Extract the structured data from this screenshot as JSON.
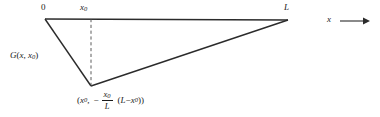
{
  "figure": {
    "kind": "greens-function-diagram",
    "background_color": "#ffffff",
    "line_color": "#2b2b2b",
    "text_color": "#1a1a1a"
  },
  "labels": {
    "origin": "0",
    "x0_top": "x",
    "x0_top_sub": "0",
    "L_top": "L",
    "function_name": "G",
    "function_args_open": "(",
    "function_arg1": "x",
    "function_comma": ", ",
    "function_arg2": "x",
    "function_arg2_sub": "0",
    "function_args_close": ")",
    "axis_label": "x"
  },
  "coordinate_expression": {
    "open_paren": "(",
    "first_component": "x",
    "first_component_sub": "0",
    "comma": ",",
    "minus_sign": "−",
    "fraction_numerator": "x",
    "fraction_numerator_sub": "0",
    "fraction_denominator": "L",
    "factor_open_paren": "(",
    "factor_left": "L",
    "factor_minus": "−",
    "factor_right": "x",
    "factor_right_sub": "0",
    "factor_close_paren": ")",
    "close_paren": ")"
  },
  "geometry": {
    "point_origin": {
      "x": 45,
      "y": 19
    },
    "point_L": {
      "x": 288,
      "y": 20
    },
    "point_min": {
      "x": 91,
      "y": 86
    },
    "dashed_line_x": 91,
    "dashed_line_top_y": 19,
    "dashed_line_bottom_y": 86,
    "axis_arrow_start_x": 340,
    "axis_arrow_end_x": 369,
    "axis_arrow_y": 21
  }
}
